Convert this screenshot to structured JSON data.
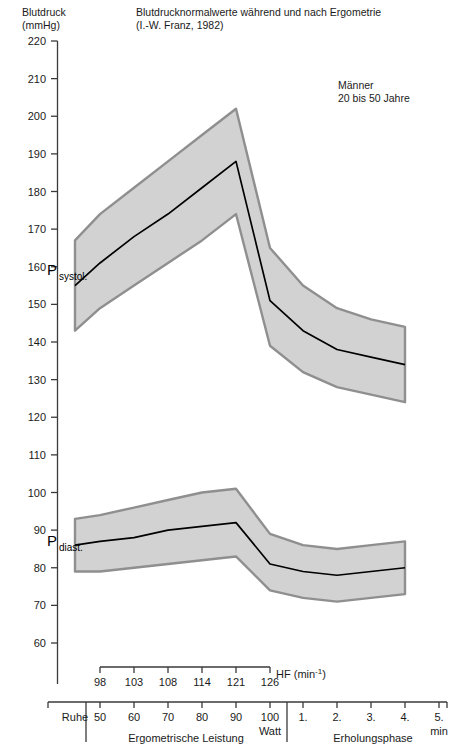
{
  "header": {
    "y_axis_caption": "Blutdruck\n(mmHg)",
    "title": "Blutdrucknormalwerte  während und nach Ergometrie\n(I.-W. Franz, 1982)",
    "cohort_note": "Männer\n20 bis 50 Jahre"
  },
  "labels": {
    "systolic_main": "P",
    "systolic_sub": "systol.",
    "diastolic_main": "P",
    "diastolic_sub": "diast.",
    "hf_caption": "HF (min",
    "hf_exponent": "-1",
    "hf_caption_end": ")",
    "rest": "Ruhe",
    "watt_unit": "Watt",
    "load_phase": "Ergometrische Leistung",
    "recovery_phase": "Erholungsphase",
    "minute_unit": "min"
  },
  "chart_data": {
    "type": "area",
    "title": "Blutdrucknormalwerte während und nach Ergometrie (I.-W. Franz, 1982)",
    "subtitle": "Männer, 20 bis 50 Jahre",
    "ylabel": "Blutdruck (mmHg)",
    "xlabel": "Ergometrische Leistung (Watt) / Erholungsphase (min)",
    "ylim": [
      60,
      220
    ],
    "ytick_step": 10,
    "yticks": [
      60,
      70,
      80,
      90,
      100,
      110,
      120,
      130,
      140,
      150,
      160,
      170,
      180,
      190,
      200,
      210,
      220
    ],
    "grid": false,
    "legend": "none",
    "x_categories": [
      "Ruhe",
      "50",
      "60",
      "70",
      "80",
      "90",
      "100",
      "1.",
      "2.",
      "3.",
      "4.",
      "5."
    ],
    "x_load_watt": [
      50,
      60,
      70,
      80,
      90,
      100
    ],
    "x_recovery_min": [
      "1.",
      "2.",
      "3.",
      "4.",
      "5."
    ],
    "hf_values": [
      98,
      103,
      108,
      114,
      121,
      126
    ],
    "hf_positions": [
      "50",
      "60",
      "70",
      "80",
      "90",
      "100"
    ],
    "series": [
      {
        "name": "P systol. (Mittelwert)",
        "values": [
          155,
          161,
          168,
          174,
          181,
          188,
          151,
          143,
          138,
          136,
          134
        ]
      },
      {
        "name": "P systol. (oberer Normbereich)",
        "values": [
          167,
          174,
          181,
          188,
          195,
          202,
          165,
          155,
          149,
          146,
          144
        ]
      },
      {
        "name": "P systol. (unterer Normbereich)",
        "values": [
          143,
          149,
          155,
          161,
          167,
          174,
          139,
          132,
          128,
          126,
          124
        ]
      },
      {
        "name": "P diast. (Mittelwert)",
        "values": [
          86,
          87,
          88,
          90,
          91,
          92,
          81,
          79,
          78,
          79,
          80
        ]
      },
      {
        "name": "P diast. (oberer Normbereich)",
        "values": [
          93,
          94,
          96,
          98,
          100,
          101,
          89,
          86,
          85,
          86,
          87
        ]
      },
      {
        "name": "P diast. (unterer Normbereich)",
        "values": [
          79,
          79,
          80,
          81,
          82,
          83,
          74,
          72,
          71,
          72,
          73
        ]
      }
    ],
    "annotations": [
      {
        "text": "P systol.",
        "at_x": "Ruhe",
        "at_y": 160
      },
      {
        "text": "P diast.",
        "at_x": "Ruhe",
        "at_y": 90
      },
      {
        "text": "Männer 20 bis 50 Jahre",
        "at_x": "90",
        "at_y": 205
      }
    ]
  }
}
